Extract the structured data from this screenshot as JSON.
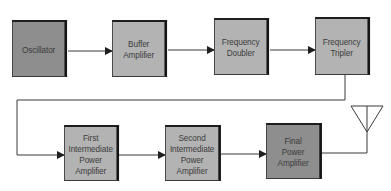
{
  "diagram": {
    "title": "",
    "type": "block-diagram",
    "colors": {
      "dark_block": "#8e8e8e",
      "light_block": "#b3b3b3",
      "line": "#3a3a3a",
      "text": "#3c3c3c"
    },
    "blocks": [
      {
        "id": "oscillator",
        "label": "Oscillator",
        "shade": "dark"
      },
      {
        "id": "buffer-amplifier",
        "label": "Buffer\nAmplifier",
        "shade": "light"
      },
      {
        "id": "frequency-doubler",
        "label": "Frequency\nDoubler",
        "shade": "light"
      },
      {
        "id": "frequency-tripler",
        "label": "Frequency\nTripler",
        "shade": "light"
      },
      {
        "id": "first-intermediate-power-amplifier",
        "label": "First\nIntermediate\nPower\nAmplifier",
        "shade": "light"
      },
      {
        "id": "second-intermediate-power-amplifier",
        "label": "Second\nIntermediate\nPower\nAmplifier",
        "shade": "light"
      },
      {
        "id": "final-power-amplifier",
        "label": "Final\nPower\nAmplifier",
        "shade": "dark"
      }
    ],
    "connections": [
      {
        "from": "oscillator",
        "to": "buffer-amplifier"
      },
      {
        "from": "buffer-amplifier",
        "to": "frequency-doubler"
      },
      {
        "from": "frequency-doubler",
        "to": "frequency-tripler"
      },
      {
        "from": "frequency-tripler",
        "to": "first-intermediate-power-amplifier"
      },
      {
        "from": "first-intermediate-power-amplifier",
        "to": "second-intermediate-power-amplifier"
      },
      {
        "from": "second-intermediate-power-amplifier",
        "to": "final-power-amplifier"
      },
      {
        "from": "final-power-amplifier",
        "to": "antenna"
      }
    ],
    "output": {
      "id": "antenna",
      "symbol": "antenna-icon"
    }
  }
}
